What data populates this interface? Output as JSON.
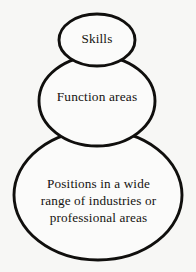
{
  "diagram": {
    "type": "nested-stacked-ellipses",
    "background_color": "#f7f7f5",
    "stroke_color": "#100f0d",
    "fill_color": "#fbfbfa",
    "text_color": "#151310",
    "levels": [
      {
        "id": "skills",
        "label": "Skills",
        "order": 1,
        "size": "small",
        "cx": 97,
        "cy": 40,
        "rx": 39,
        "ry": 27
      },
      {
        "id": "function-areas",
        "label": "Function areas",
        "order": 2,
        "size": "medium",
        "cx": 97,
        "cy": 101,
        "rx": 59,
        "ry": 46
      },
      {
        "id": "positions",
        "label": "Positions in a wide\nrange of industries or\nprofessional areas",
        "label_lines": [
          "Positions in a wide",
          "range of industries or",
          "professional areas"
        ],
        "order": 3,
        "size": "large",
        "cx": 98,
        "cy": 195,
        "rx": 85,
        "ry": 66
      }
    ]
  }
}
